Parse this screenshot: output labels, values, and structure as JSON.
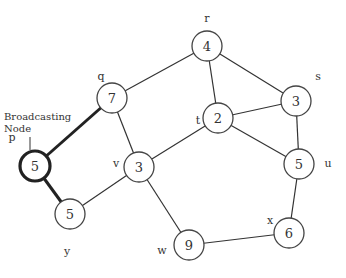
{
  "diagram": {
    "annotation": {
      "line1": "Broadcasting",
      "line2": "Node"
    },
    "broadcasting_node": "p",
    "nodes": [
      {
        "id": "r",
        "value": "4",
        "x": 207,
        "y": 46,
        "lx": 207,
        "ly": 18
      },
      {
        "id": "q",
        "value": "7",
        "x": 112,
        "y": 98,
        "lx": 101,
        "ly": 76
      },
      {
        "id": "s",
        "value": "3",
        "x": 296,
        "y": 101,
        "lx": 318,
        "ly": 76
      },
      {
        "id": "t",
        "value": "2",
        "x": 218,
        "y": 118,
        "lx": 198,
        "ly": 120
      },
      {
        "id": "p",
        "value": "5",
        "x": 35,
        "y": 166,
        "lx": 12,
        "ly": 137
      },
      {
        "id": "v",
        "value": "3",
        "x": 139,
        "y": 167,
        "lx": 116,
        "ly": 163
      },
      {
        "id": "u",
        "value": "5",
        "x": 299,
        "y": 164,
        "lx": 328,
        "ly": 163
      },
      {
        "id": "y",
        "value": "5",
        "x": 70,
        "y": 214,
        "lx": 67,
        "ly": 251
      },
      {
        "id": "x",
        "value": "6",
        "x": 289,
        "y": 233,
        "lx": 270,
        "ly": 220
      },
      {
        "id": "w",
        "value": "9",
        "x": 189,
        "y": 245,
        "lx": 162,
        "ly": 250
      }
    ],
    "edges": [
      {
        "from": "q",
        "to": "r",
        "bold": false
      },
      {
        "from": "r",
        "to": "t",
        "bold": false
      },
      {
        "from": "r",
        "to": "s",
        "bold": false
      },
      {
        "from": "t",
        "to": "s",
        "bold": false
      },
      {
        "from": "t",
        "to": "u",
        "bold": false
      },
      {
        "from": "s",
        "to": "u",
        "bold": false
      },
      {
        "from": "q",
        "to": "v",
        "bold": false
      },
      {
        "from": "v",
        "to": "t",
        "bold": false
      },
      {
        "from": "v",
        "to": "y",
        "bold": false
      },
      {
        "from": "v",
        "to": "w",
        "bold": false
      },
      {
        "from": "u",
        "to": "x",
        "bold": false
      },
      {
        "from": "x",
        "to": "w",
        "bold": false
      },
      {
        "from": "p",
        "to": "q",
        "bold": true
      },
      {
        "from": "p",
        "to": "y",
        "bold": true
      }
    ]
  }
}
